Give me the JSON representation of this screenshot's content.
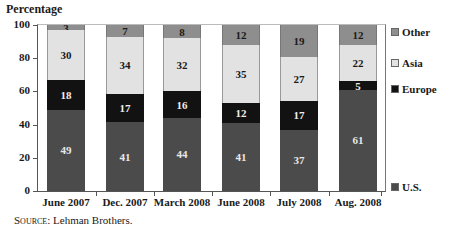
{
  "chart_data": {
    "type": "bar",
    "stacked": true,
    "title": "",
    "ylabel": "Percentage",
    "xlabel": "",
    "ylim": [
      0,
      100
    ],
    "yticks": [
      0,
      20,
      40,
      60,
      80,
      100
    ],
    "grid": false,
    "legend_position": "right",
    "categories": [
      "June 2007",
      "Dec. 2007",
      "March 2008",
      "June 2008",
      "July 2008",
      "Aug. 2008"
    ],
    "series": [
      {
        "name": "U.S.",
        "key": "us",
        "color": "#4b4b4b",
        "values": [
          49,
          41,
          44,
          41,
          37,
          61
        ]
      },
      {
        "name": "Europe",
        "key": "europe",
        "color": "#121212",
        "values": [
          18,
          17,
          16,
          12,
          17,
          5
        ]
      },
      {
        "name": "Asia",
        "key": "asia",
        "color": "#e2e2e2",
        "values": [
          30,
          34,
          32,
          35,
          27,
          22
        ]
      },
      {
        "name": "Other",
        "key": "other",
        "color": "#8e8e8e",
        "values": [
          3,
          7,
          8,
          12,
          19,
          12
        ]
      }
    ],
    "source": "Lehman Brothers."
  },
  "labels": {
    "y_axis_title": "Percentage",
    "source_prefix": "Source:",
    "source_text": " Lehman Brothers."
  },
  "legend": [
    {
      "name": "Other",
      "color": "#8e8e8e",
      "top": 26
    },
    {
      "name": "Asia",
      "color": "#e2e2e2",
      "top": 57
    },
    {
      "name": "Europe",
      "color": "#121212",
      "top": 83
    },
    {
      "name": "U.S.",
      "color": "#4b4b4b",
      "top": 181
    }
  ]
}
